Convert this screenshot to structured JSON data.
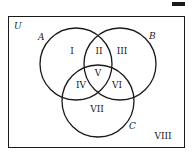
{
  "diagram": {
    "type": "venn",
    "universe_label": "U",
    "sets": [
      {
        "name": "A",
        "label": "A"
      },
      {
        "name": "B",
        "label": "B"
      },
      {
        "name": "C",
        "label": "C"
      }
    ],
    "regions": [
      {
        "id": "I",
        "label": "I",
        "description": "A only"
      },
      {
        "id": "II",
        "label": "II",
        "description": "A and B only"
      },
      {
        "id": "III",
        "label": "III",
        "description": "B only"
      },
      {
        "id": "IV",
        "label": "IV",
        "description": "A and C only"
      },
      {
        "id": "V",
        "label": "V",
        "description": "A, B and C"
      },
      {
        "id": "VI",
        "label": "VI",
        "description": "B and C only"
      },
      {
        "id": "VII",
        "label": "VII",
        "description": "C only"
      },
      {
        "id": "VIII",
        "label": "VIII",
        "description": "outside A, B, C"
      }
    ]
  },
  "colors": {
    "stroke": "#1a1a1a",
    "background": "#ffffff"
  }
}
